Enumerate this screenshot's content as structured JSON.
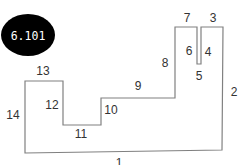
{
  "badge": {
    "label": "6.101",
    "bg_color": "#000000",
    "text_color": "#ffffff"
  },
  "polygon": {
    "stroke_color": "#808080",
    "points": "25,153 222,150 223,27 201,27 201,64 197,64 197,27 175,27 175,98 101,98 101,125 63,125 63,81 25,81"
  },
  "edge_labels": [
    {
      "id": "1",
      "text": "1",
      "x": 119,
      "y": 167
    },
    {
      "id": "2",
      "text": "2",
      "x": 230,
      "y": 92
    },
    {
      "id": "3",
      "text": "3",
      "x": 210,
      "y": 22
    },
    {
      "id": "4",
      "text": "4",
      "x": 204,
      "y": 55
    },
    {
      "id": "5",
      "text": "5",
      "x": 195,
      "y": 78
    },
    {
      "id": "6",
      "text": "6",
      "x": 183,
      "y": 54
    },
    {
      "id": "7",
      "text": "7",
      "x": 184,
      "y": 22
    },
    {
      "id": "8",
      "text": "8",
      "x": 162,
      "y": 67
    },
    {
      "id": "9",
      "text": "9",
      "x": 134,
      "y": 89
    },
    {
      "id": "10",
      "text": "10",
      "x": 103,
      "y": 114
    },
    {
      "id": "11",
      "text": "11",
      "x": 75,
      "y": 137
    },
    {
      "id": "12",
      "text": "12",
      "x": 45,
      "y": 107
    },
    {
      "id": "13",
      "text": "13",
      "x": 37,
      "y": 74
    },
    {
      "id": "14",
      "text": "14",
      "x": 7,
      "y": 117
    }
  ]
}
